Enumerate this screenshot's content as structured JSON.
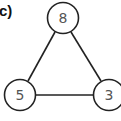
{
  "figure": {
    "panel_label": "c)"
  },
  "graph": {
    "nodes": [
      {
        "id": "top",
        "label": "8",
        "cx": 63,
        "cy": 18
      },
      {
        "id": "bottom-left",
        "label": "5",
        "cx": 20,
        "cy": 95
      },
      {
        "id": "bottom-right",
        "label": "3",
        "cx": 109,
        "cy": 95
      }
    ],
    "edges": [
      {
        "from": "top",
        "to": "bottom-left"
      },
      {
        "from": "top",
        "to": "bottom-right"
      },
      {
        "from": "bottom-left",
        "to": "bottom-right"
      }
    ],
    "colors": {
      "stroke": "#222222",
      "node_fill": "#ffffff",
      "text": "#555555"
    }
  }
}
